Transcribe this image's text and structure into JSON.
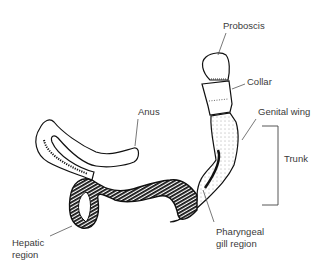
{
  "figure": {
    "labels": {
      "proboscis": "Proboscis",
      "collar": "Collar",
      "genital_wing": "Genital wing",
      "trunk": "Trunk",
      "anus": "Anus",
      "hepatic_region_line1": "Hepatic",
      "hepatic_region_line2": "region",
      "pharyngeal_line1": "Pharyngeal",
      "pharyngeal_line2": "gill region"
    },
    "colors": {
      "ink": "#111111",
      "label_text": "#3a3a3a",
      "leader_line": "#555555",
      "background": "#ffffff"
    }
  }
}
